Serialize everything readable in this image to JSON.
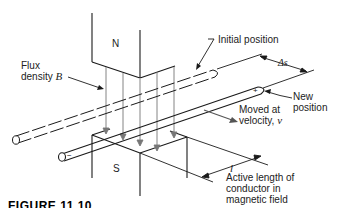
{
  "figure": {
    "caption": "FIGURE 11.10"
  },
  "magnets": {
    "north_label": "N",
    "south_label": "S"
  },
  "labels": {
    "flux_line1": "Flux",
    "flux_line2": "density",
    "flux_symbol": "B",
    "initial_position": "Initial position",
    "delta_s": "Δs",
    "new_line1": "New",
    "new_line2": "position",
    "moved_line1": "Moved at",
    "moved_line2": "velocity,",
    "velocity_symbol": "v",
    "length_symbol": "l",
    "active_line1": "Active length of",
    "active_line2": "conductor in",
    "active_line3": "magnetic field"
  },
  "conductor_markers": {
    "plus": "+",
    "minus": "−"
  },
  "colors": {
    "line": "#1a1a1a",
    "flux_line": "#888888",
    "background": "#ffffff"
  }
}
